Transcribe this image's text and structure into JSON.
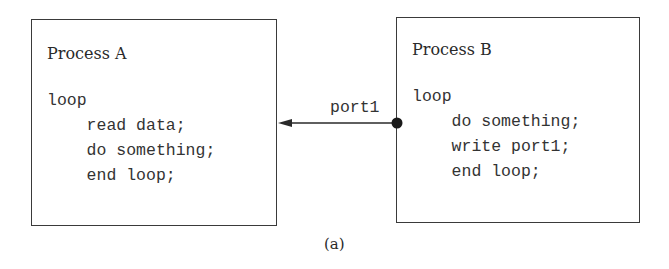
{
  "diagram": {
    "process_a": {
      "title": "Process A",
      "code": [
        "loop",
        "    read data;",
        "    do something;",
        "    end loop;"
      ]
    },
    "process_b": {
      "title": "Process B",
      "code": [
        "loop",
        "    do something;",
        "    write port1;",
        "    end loop;"
      ]
    },
    "connection": {
      "label": "port1",
      "direction": "from Process B to Process A"
    },
    "caption": "(a)"
  }
}
